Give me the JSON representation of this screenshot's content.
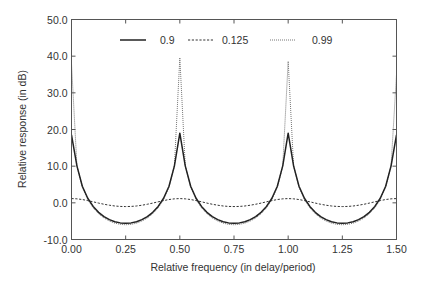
{
  "chart_data": {
    "type": "line",
    "title": "",
    "xlabel": "Relative frequency  (in delay/period)",
    "ylabel": "Relative response  (in dB)",
    "xlim": [
      0.0,
      1.5
    ],
    "ylim": [
      -10.0,
      50.0
    ],
    "grid": false,
    "legend_position": "top-center",
    "x_ticks": [
      0.0,
      0.25,
      0.5,
      0.75,
      1.0,
      1.25,
      1.5
    ],
    "x_tick_labels": [
      "0.00",
      "0.25",
      "0.50",
      "0.75",
      "1.00",
      "1.25",
      "1.50"
    ],
    "y_ticks": [
      -10,
      0,
      10,
      20,
      30,
      40,
      50
    ],
    "y_tick_labels": [
      "-10.0",
      "0.0",
      "10.0",
      "20.0",
      "30.0",
      "40.0",
      "50.0"
    ],
    "x": [
      0.0,
      0.025,
      0.05,
      0.075,
      0.1,
      0.125,
      0.15,
      0.175,
      0.2,
      0.225,
      0.25,
      0.275,
      0.3,
      0.325,
      0.35,
      0.375,
      0.4,
      0.425,
      0.45,
      0.475,
      0.5,
      0.525,
      0.55,
      0.575,
      0.6,
      0.625,
      0.65,
      0.675,
      0.7,
      0.725,
      0.75,
      0.775,
      0.8,
      0.825,
      0.85,
      0.875,
      0.9,
      0.925,
      0.95,
      0.975,
      1.0,
      1.025,
      1.05,
      1.075,
      1.1,
      1.125,
      1.15,
      1.175,
      1.2,
      1.225,
      1.25,
      1.275,
      1.3,
      1.325,
      1.35,
      1.375,
      1.4,
      1.425,
      1.45,
      1.475,
      1.5
    ],
    "series": [
      {
        "name": "0.9",
        "style": "solid",
        "color": "#222222",
        "values": [
          18.5,
          10.09,
          4.51,
          1.24,
          -0.98,
          -2.58,
          -3.74,
          -4.58,
          -5.14,
          -5.47,
          -5.58,
          -5.47,
          -5.14,
          -4.58,
          -3.74,
          -2.58,
          -0.98,
          1.24,
          4.51,
          10.09,
          19.0,
          10.09,
          4.51,
          1.24,
          -0.98,
          -2.58,
          -3.74,
          -4.58,
          -5.14,
          -5.47,
          -5.58,
          -5.47,
          -5.14,
          -4.58,
          -3.74,
          -2.58,
          -0.98,
          1.24,
          4.51,
          10.09,
          19.0,
          10.09,
          4.51,
          1.24,
          -0.98,
          -2.58,
          -3.74,
          -4.58,
          -5.14,
          -5.47,
          -5.58,
          -5.47,
          -5.14,
          -4.58,
          -3.74,
          -2.58,
          -0.98,
          1.24,
          4.51,
          10.09,
          18.5
        ]
      },
      {
        "name": "0.125",
        "style": "dashed",
        "color": "#333333",
        "values": [
          1.16,
          1.09,
          0.9,
          0.61,
          0.28,
          -0.07,
          -0.39,
          -0.65,
          -0.86,
          -0.98,
          -1.02,
          -0.98,
          -0.86,
          -0.65,
          -0.39,
          -0.07,
          0.28,
          0.61,
          0.9,
          1.09,
          1.16,
          1.09,
          0.9,
          0.61,
          0.28,
          -0.07,
          -0.39,
          -0.65,
          -0.86,
          -0.98,
          -1.02,
          -0.98,
          -0.86,
          -0.65,
          -0.39,
          -0.07,
          0.28,
          0.61,
          0.9,
          1.09,
          1.16,
          1.09,
          0.9,
          0.61,
          0.28,
          -0.07,
          -0.39,
          -0.65,
          -0.86,
          -0.98,
          -1.02,
          -0.98,
          -0.86,
          -0.65,
          -0.39,
          -0.07,
          0.28,
          0.61,
          0.9,
          1.09,
          1.16
        ]
      },
      {
        "name": "0.99",
        "style": "dotted",
        "color": "#666666",
        "values": [
          38.0,
          10.14,
          4.22,
          0.88,
          -1.36,
          -2.97,
          -4.14,
          -4.97,
          -5.54,
          -5.87,
          -5.98,
          -5.87,
          -5.54,
          -4.97,
          -4.14,
          -2.97,
          -1.36,
          0.88,
          4.22,
          10.14,
          39.6,
          10.14,
          4.22,
          0.88,
          -1.36,
          -2.97,
          -4.14,
          -4.97,
          -5.54,
          -5.87,
          -5.98,
          -5.87,
          -5.54,
          -4.97,
          -4.14,
          -2.97,
          -1.36,
          0.88,
          4.22,
          10.14,
          38.6,
          10.14,
          4.22,
          0.88,
          -1.36,
          -2.97,
          -4.14,
          -4.97,
          -5.54,
          -5.87,
          -5.98,
          -5.87,
          -5.54,
          -4.97,
          -4.14,
          -2.97,
          -1.36,
          0.88,
          4.22,
          10.14,
          35.0
        ]
      }
    ]
  }
}
